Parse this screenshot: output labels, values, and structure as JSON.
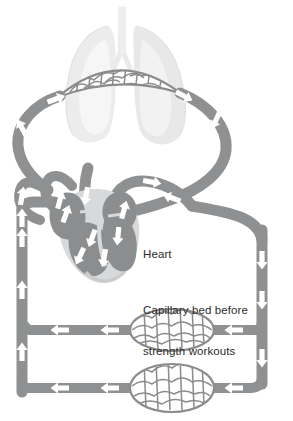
{
  "labels": {
    "heart": "Heart",
    "capillary_bed_line1": "Capillary bed before",
    "capillary_bed_line2": "strength workouts"
  },
  "structures": {
    "lungs": "lungs",
    "trachea": "trachea",
    "pulmonary_capillary_bed": "pulmonary-capillary-bed",
    "heart": "heart",
    "systemic_capillary_bed_upper": "systemic-capillary-bed-upper",
    "systemic_capillary_bed_lower": "systemic-capillary-bed-lower",
    "vessels": "blood-vessels",
    "flow_arrows": "flow-direction-arrows"
  },
  "colors": {
    "background": "#ffffff",
    "vessel": "#8f9091",
    "vessel_shade": "#7e7f80",
    "vessel_edge": "#6f7071",
    "capillary_mesh": "#8a8b8c",
    "lung": "#ececec",
    "lung_light": "#f4f4f4",
    "lung_edge": "#e0e0e0",
    "heart_chamber": "#8c8d8e",
    "heart_muscle": "#d6d7d8",
    "arrow": "#ffffff",
    "text": "#2b2b2b"
  },
  "arrow_counts": {
    "left_ascending": 4,
    "right_descending": 4,
    "upper_circuit_leftward": 3,
    "lower_circuit_leftward": 3,
    "heart_internal": 7
  }
}
